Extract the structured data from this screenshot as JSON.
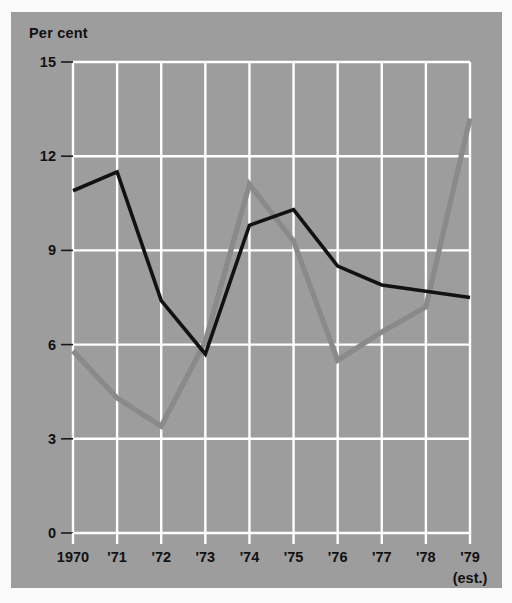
{
  "figure": {
    "background_color": "#fbfbfb",
    "panel_color": "#9d9d9d",
    "grid_color": "#ffffff"
  },
  "chart_data": {
    "type": "line",
    "title": "",
    "ylabel": "Per cent",
    "xlabel": "",
    "ylim": [
      0,
      15
    ],
    "yticks": [
      0,
      3,
      6,
      9,
      12,
      15
    ],
    "ytick_labels": [
      "0",
      "3",
      "6",
      "9",
      "12",
      "15"
    ],
    "grid": true,
    "legend": "none",
    "x": [
      "1970",
      "'71",
      "'72",
      "'73",
      "'74",
      "'75",
      "'76",
      "'77",
      "'78",
      "'79"
    ],
    "xtick_labels": [
      "1970",
      "'71",
      "'72",
      "'73",
      "'74",
      "'75",
      "'76",
      "'77",
      "'78",
      "'79"
    ],
    "xtick_sublabel_last": "(est.)",
    "series": [
      {
        "name": "black-line",
        "color": "#121212",
        "width": 3.6,
        "values": [
          10.9,
          11.5,
          7.4,
          5.7,
          9.8,
          10.3,
          8.5,
          7.9,
          7.7,
          7.5
        ]
      },
      {
        "name": "gray-line",
        "color": "#8a8a8a",
        "width": 5.2,
        "values": [
          5.8,
          4.3,
          3.4,
          6.1,
          11.1,
          9.3,
          5.5,
          6.4,
          7.2,
          13.2
        ]
      }
    ]
  }
}
